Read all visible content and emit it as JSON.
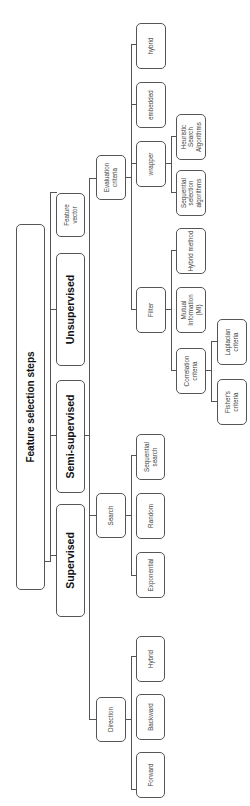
{
  "diagram": {
    "title": "Feature selection steps",
    "root": {
      "label": "Feature selection steps",
      "children": [
        {
          "label": "Supervised"
        },
        {
          "label": "Semi-supervised"
        },
        {
          "label": "Unsupervised"
        },
        {
          "label": "Feature vector"
        }
      ]
    },
    "nodes": {
      "root": "Feature selection steps",
      "supervised": "Supervised",
      "semi_supervised": "Semi-supervised",
      "unsupervised": "Unsupervised",
      "feature_vector": "Feature vector",
      "direction": "Direction",
      "search": "Search",
      "evaluation_criteria": "Evaluation criteria",
      "forward": "Forward",
      "backward": "Backward",
      "hybrid_direction": "Hybrid",
      "exponential": "Exponential",
      "random": "Random",
      "sequential_search": "Sequential search",
      "filter": "Filter",
      "wrapper": "wrapper",
      "embedded": "embedded",
      "hybrid_eval": "hybrid",
      "correlation_criteria": "Correlation criteria",
      "mutual_information": "Mutual Information (MI)",
      "hybrid_method": "Hybrid method",
      "sequential_selection": "Sequential selection algorithms",
      "heuristic_search": "Heuristic Search Algorithms",
      "fishers_criteria": "Fisher's criteria",
      "laplacian_criteria": "Laplacian criteria"
    },
    "hierarchy": {
      "Feature selection steps": [
        "Supervised",
        "Semi-supervised",
        "Unsupervised",
        "Feature vector"
      ],
      "Supervised/Semi-supervised/Unsupervised": [
        "Direction",
        "Search",
        "Evaluation criteria"
      ],
      "Direction": [
        "Forward",
        "Backward",
        "Hybrid"
      ],
      "Search": [
        "Exponential",
        "Random",
        "Sequential search"
      ],
      "Evaluation criteria": [
        "Filter",
        "wrapper",
        "embedded",
        "hybrid"
      ],
      "Filter": [
        "Correlation criteria",
        "Mutual Information (MI)",
        "Hybrid method"
      ],
      "Correlation criteria": [
        "Fisher's criteria",
        "Laplacian criteria"
      ],
      "wrapper": [
        "Sequential selection algorithms",
        "Heuristic Search Algorithms"
      ]
    },
    "colors": {
      "border": "#555555",
      "background": "#ffffff",
      "text": "#333333"
    }
  }
}
